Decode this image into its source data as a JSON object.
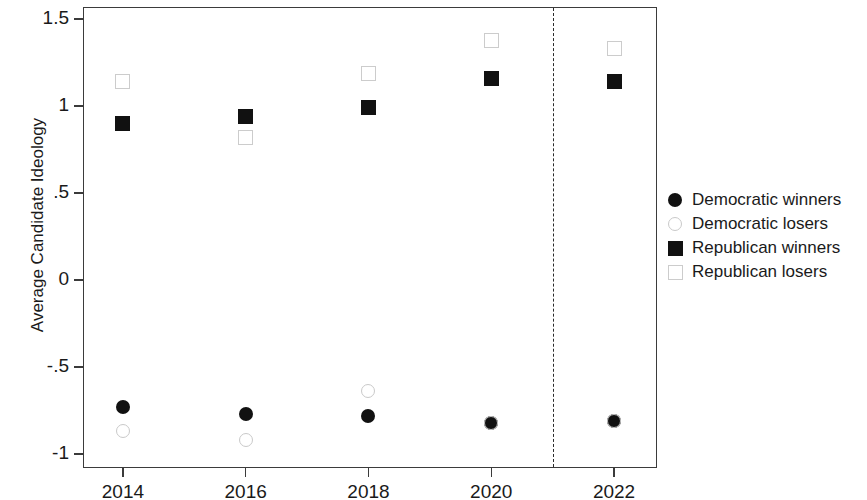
{
  "chart_data": {
    "type": "scatter",
    "title": "",
    "xlabel": "",
    "ylabel": "Average Candidate Ideology",
    "x": [
      2014,
      2016,
      2018,
      2020,
      2022
    ],
    "xticklabels": [
      "2014",
      "2016",
      "2018",
      "2020",
      "2022"
    ],
    "yticklabels": [
      "1.5",
      "1",
      ".5",
      "0",
      "-.5",
      "-1"
    ],
    "ytickvalues": [
      1.5,
      1,
      0.5,
      0,
      -0.5,
      -1
    ],
    "ylim": [
      -1.08,
      1.57
    ],
    "xlim": [
      2013.35,
      2022.7
    ],
    "grid": false,
    "legend_position": "right",
    "series": [
      {
        "name": "Democratic winners",
        "marker": "circle-filled",
        "color": "#111111",
        "values": [
          -0.73,
          -0.77,
          -0.78,
          -0.82,
          -0.81
        ]
      },
      {
        "name": "Democratic losers",
        "marker": "circle-open",
        "color": "#c9c9c9",
        "values": [
          -0.87,
          -0.92,
          -0.64,
          -0.82,
          -0.81
        ]
      },
      {
        "name": "Republican winners",
        "marker": "square-filled",
        "color": "#111111",
        "values": [
          0.9,
          0.94,
          0.99,
          1.16,
          1.14
        ]
      },
      {
        "name": "Republican losers",
        "marker": "square-open",
        "color": "#cccccc",
        "values": [
          1.14,
          0.82,
          1.19,
          1.38,
          1.33
        ]
      }
    ],
    "annotations": [
      {
        "type": "vertical-dashed-line",
        "x": 2021,
        "label": ""
      }
    ]
  },
  "legend": {
    "items": [
      {
        "label": "Democratic winners",
        "marker": "circle-filled"
      },
      {
        "label": "Democratic losers",
        "marker": "circle-open"
      },
      {
        "label": "Republican winners",
        "marker": "square-filled"
      },
      {
        "label": "Republican losers",
        "marker": "square-open"
      }
    ]
  }
}
